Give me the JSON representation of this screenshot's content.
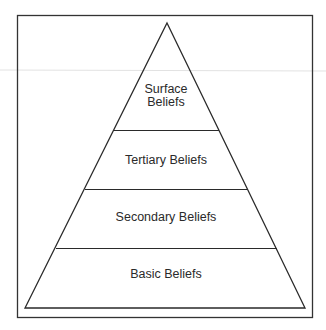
{
  "diagram": {
    "type": "pyramid",
    "levels": [
      {
        "label_lines": [
          "Surface",
          "Beliefs"
        ]
      },
      {
        "label_lines": [
          "Tertiary Beliefs"
        ]
      },
      {
        "label_lines": [
          "Secondary Beliefs"
        ]
      },
      {
        "label_lines": [
          "Basic Beliefs"
        ]
      }
    ]
  },
  "colors": {
    "line": "#2a2a2a",
    "frame": "#333333",
    "background": "#ffffff"
  }
}
